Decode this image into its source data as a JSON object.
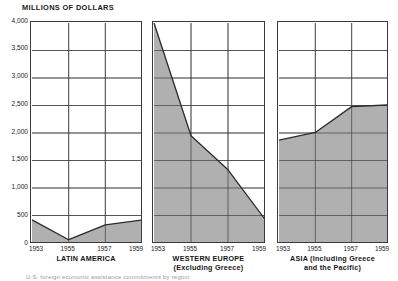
{
  "chart_data": {
    "type": "area",
    "title": "MILLIONS OF DOLLARS",
    "xlabel": "",
    "ylabel": "MILLIONS OF DOLLARS",
    "ylim": [
      0,
      4000
    ],
    "ytick_values": [
      4000,
      3500,
      3000,
      2500,
      2000,
      1500,
      1000,
      500,
      0
    ],
    "ytick_labels": [
      "4,000",
      "3,500",
      "3,000",
      "2,500",
      "2,000",
      "1,500",
      "1,000",
      "500",
      "0"
    ],
    "x": [
      1953,
      1955,
      1957,
      1959
    ],
    "xtick_labels": [
      "1953",
      "1955",
      "1957",
      "1959"
    ],
    "grid": true,
    "legend": "none",
    "fill_color": "#b0b0b0",
    "line_color": "#2b2b2b",
    "grid_color": "#555555",
    "panels": [
      {
        "key": "latin-america",
        "caption_lines": [
          "LATIN AMERICA"
        ],
        "values": [
          420,
          60,
          330,
          420
        ]
      },
      {
        "key": "western-europe",
        "caption_lines": [
          "WESTERN EUROPE",
          "(Excluding Greece)"
        ],
        "values": [
          4000,
          1950,
          1330,
          430
        ]
      },
      {
        "key": "asia",
        "caption_lines": [
          "ASIA (Including Greece",
          "and the Pacific)"
        ],
        "values": [
          1870,
          2010,
          2480,
          2510
        ]
      }
    ]
  },
  "footnote": {
    "text": "U.S. foreign economic assistance commitments by region"
  }
}
